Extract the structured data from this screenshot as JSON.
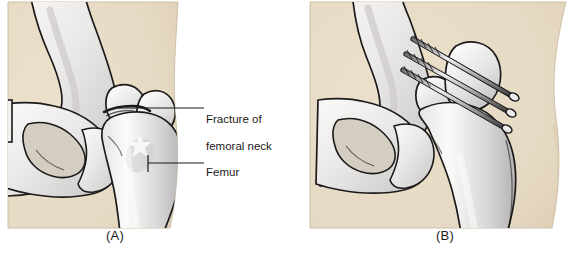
{
  "figure": {
    "type": "medical-illustration"
  },
  "panels": [
    {
      "id": "A",
      "caption": "(A)",
      "description": "Anterior view of hip joint showing a fracture of the femoral neck",
      "labels": [
        {
          "name": "fracture-of-femoral-neck",
          "text": "Fracture of\nfemoral neck",
          "line1": "Fracture of",
          "line2": "femoral neck"
        },
        {
          "name": "femur",
          "text": "Femur",
          "line1": "Femur",
          "line2": ""
        }
      ]
    },
    {
      "id": "B",
      "caption": "(B)",
      "description": "Same hip after internal fixation with three parallel cannulated screws across the femoral neck",
      "hardware": {
        "name": "cannulated-screws",
        "count": 3
      }
    }
  ],
  "colors": {
    "page_background": "#ffffff",
    "skin": "#e9dcc6",
    "skin_shadow": "#dccdb4",
    "bone_light": "#f4f2ef",
    "bone_mid": "#d9d7d6",
    "bone_shadow": "#b9b7b8",
    "outline": "#1a1a1a",
    "metal_light": "#e8e8ea",
    "metal_dark": "#4a4a4c",
    "label_text": "#1a1a1a",
    "leader_line": "#1a1a1a"
  }
}
